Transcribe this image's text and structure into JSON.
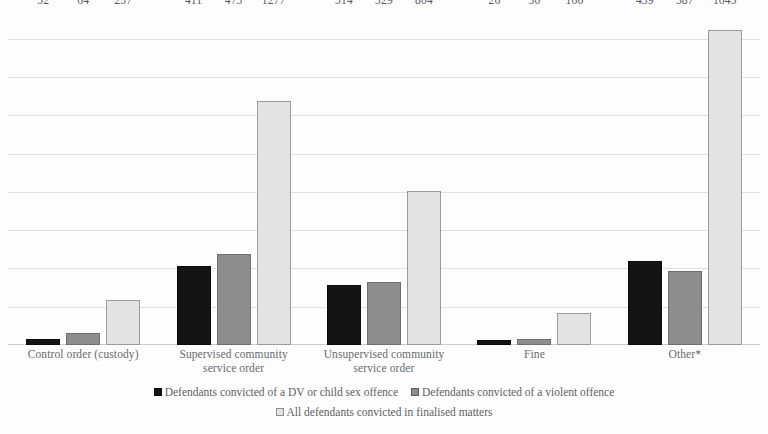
{
  "chart_data": {
    "type": "bar",
    "title": "",
    "subtitle": "",
    "xlabel": "",
    "ylabel": "",
    "ylim": [
      0,
      1760
    ],
    "grid": true,
    "gridline_interval": 200,
    "gridline_count": 8,
    "y_tick_labels_shown": false,
    "legend_position": "bottom",
    "orientation": "vertical",
    "grouped": true,
    "categories": [
      "Control order (custody)",
      "Supervised community service order",
      "Unsupervised community service order",
      "Fine",
      "Other*"
    ],
    "series": [
      {
        "name": "Defendants convicted of a DV or child sex offence",
        "color": "#141414",
        "values": [
          32,
          411,
          314,
          26,
          439
        ],
        "labels": [
          "32",
          "411",
          "314",
          "26",
          "439"
        ]
      },
      {
        "name": "Defendants convicted of a violent offence",
        "color": "#8d8d8d",
        "values": [
          64,
          473,
          329,
          30,
          387
        ],
        "labels": [
          "64",
          "473",
          "329",
          "30",
          "387"
        ]
      },
      {
        "name": "All defendants convicted in finalised matters",
        "color": "#e3e3e3",
        "values": [
          237,
          1277,
          804,
          166,
          1643
        ],
        "labels": [
          "237",
          "1277",
          "804",
          "166",
          "1643"
        ]
      }
    ],
    "annotations": [
      "*"
    ]
  },
  "categories_display": [
    "Control order (custody)",
    "Supervised community\nservice order",
    "Unsupervised community\nservice order",
    "Fine",
    "Other*"
  ],
  "legend": {
    "row1": [
      {
        "label": "Defendants convicted of a DV or child sex offence",
        "swatch": "black-square-marker"
      },
      {
        "label": "Defendants convicted of a violent offence",
        "swatch": "gray-square-marker"
      }
    ],
    "row2": [
      {
        "label": "All defendants convicted in finalised matters",
        "swatch": "light-gray-square-marker"
      }
    ]
  },
  "colors": {
    "series_dv_child_sex": "#141414",
    "series_violent": "#8d8d8d",
    "series_all_defendants": "#e3e3e3",
    "gridline": "#d8dce3",
    "text": "#5e5e5e",
    "background": "#ffffff"
  }
}
